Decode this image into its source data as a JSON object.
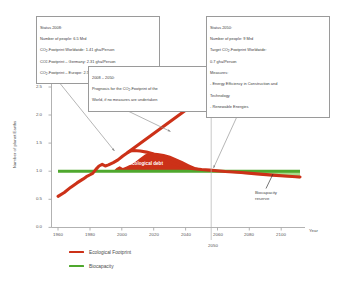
{
  "chart_data": {
    "type": "line",
    "title": "",
    "xlabel": "Year",
    "ylabel": "Number of planet Earths",
    "xlim": [
      1958,
      2103
    ],
    "ylim": [
      0.0,
      2.62
    ],
    "xticks": [
      "1960",
      "1980",
      "2000",
      "2020",
      "2040",
      "2060",
      "2080",
      "2100"
    ],
    "yticks": [
      "0.0",
      "0.5",
      "1.0",
      "1.5",
      "2.0",
      "2.5"
    ],
    "grid": false,
    "legend_position": "bottom-left",
    "series": [
      {
        "name": "Ecological Footprint",
        "color": "#CC3118",
        "comment": "historical 1961-2008 then declining measures scenario to 2100",
        "points": [
          [
            1961,
            0.55
          ],
          [
            1965,
            0.62
          ],
          [
            1970,
            0.71
          ],
          [
            1974,
            0.79
          ],
          [
            1978,
            0.86
          ],
          [
            1980,
            0.9
          ],
          [
            1982,
            0.93
          ],
          [
            1984,
            1.0
          ],
          [
            1986,
            1.06
          ],
          [
            1988,
            1.09
          ],
          [
            1990,
            1.06
          ],
          [
            1992,
            1.08
          ],
          [
            1995,
            1.12
          ],
          [
            1998,
            1.17
          ],
          [
            2001,
            1.24
          ],
          [
            2004,
            1.3
          ],
          [
            2006,
            1.33
          ],
          [
            2008,
            1.34
          ],
          [
            2012,
            1.33
          ],
          [
            2016,
            1.31
          ],
          [
            2020,
            1.28
          ],
          [
            2024,
            1.23
          ],
          [
            2028,
            1.18
          ],
          [
            2032,
            1.12
          ],
          [
            2036,
            1.07
          ],
          [
            2040,
            1.03
          ],
          [
            2044,
            1.0
          ],
          [
            2047,
            0.99
          ],
          [
            2050,
            0.98
          ],
          [
            2055,
            0.96
          ],
          [
            2060,
            0.95
          ],
          [
            2070,
            0.92
          ],
          [
            2080,
            0.9
          ],
          [
            2090,
            0.87
          ],
          [
            2100,
            0.85
          ]
        ]
      },
      {
        "name": "Prognosis (no measures)",
        "color": "#CC3118",
        "comment": "straight rising line from 2008 to about 2057",
        "points": [
          [
            2004,
            1.31
          ],
          [
            2057,
            2.52
          ]
        ]
      },
      {
        "name": "Biocapacity",
        "color": "#4FA82E",
        "comment": "constant 1.0 planet Earth",
        "points": [
          [
            1961,
            1.0
          ],
          [
            2100,
            1.0
          ]
        ]
      }
    ],
    "shaded_regions": [
      {
        "name": "Ecological debt",
        "label": "Ecological debt",
        "color": "#CC3118",
        "between": [
          "Ecological Footprint",
          "Biocapacity"
        ],
        "x_range": [
          1984,
          2050
        ]
      },
      {
        "name": "Biocapacity reserve",
        "label": "Biocapacity reserve",
        "color": "#A8D98A",
        "between": [
          "Biocapacity",
          "Ecological Footprint"
        ],
        "x_range": [
          2050,
          2100
        ]
      }
    ],
    "reference_lines": [
      {
        "name": "year-2050-marker",
        "orientation": "vertical",
        "value": 2050,
        "label": "2050"
      }
    ]
  },
  "axis": {
    "y_title": "Number of planet Earths",
    "x_unit": "Year",
    "yticks": [
      "2.5",
      "2.0",
      "1.5",
      "1.0",
      "0.5",
      "0.0"
    ],
    "xticks": [
      "1960",
      "1980",
      "2000",
      "2020",
      "2040",
      "2060",
      "2080",
      "2100"
    ],
    "vline_label": "2050"
  },
  "callouts": {
    "status_2008": {
      "lines": [
        "Status 2008:",
        "Number of people: 6.5 Mrd",
        "CO2-Footprint Worldwide: 1.41 gha/Person",
        "CO2-Footprint – Germany: 2.31 gha/Person",
        "CO2-Footprint – Europe: 2.58 gha/Person"
      ]
    },
    "prognosis": {
      "lines": [
        "2008 – 2050:",
        "Prognosis for the CO2-Footprint of the",
        "World, if no measures are undertaken"
      ]
    },
    "status_2050": {
      "lines": [
        "Status 2050:",
        "Number of people: 9 Mrd",
        "Target CO2-Footprint Worldwide:",
        "0.7 gha/Person",
        "Measures:",
        "- Energy Efficiency in Construction and",
        "Technology",
        "- Renewable Energies"
      ]
    }
  },
  "plot_labels": {
    "ecological_debt": "Ecological debt",
    "biocapacity_reserve": "Biocapacity\nreserve"
  },
  "legend": {
    "items": [
      {
        "label": "Ecological Footprint",
        "color": "#CC3118"
      },
      {
        "label": "Biocapacity",
        "color": "#4FA82E"
      }
    ]
  },
  "colors": {
    "footprint": "#CC3118",
    "biocapacity": "#4FA82E",
    "reserve_fill": "#A8D98A",
    "axis": "#9a9a9a",
    "text": "#4a4a4a"
  }
}
